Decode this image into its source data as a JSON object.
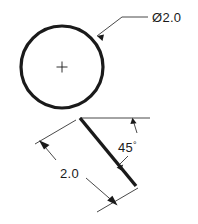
{
  "drawing": {
    "type": "engineering-dimension-sketch",
    "background_color": "#ffffff",
    "line_color": "#1a1a1a",
    "thick_stroke_width": 3.2,
    "thin_stroke_width": 0.8,
    "canvas": {
      "width": 198,
      "height": 224
    }
  },
  "annotations": {
    "diameter": {
      "label": "Ø2.0",
      "value": "2.0",
      "symbol": "Ø",
      "meaning": "diameter-of-circle",
      "text_x": 152,
      "text_y": 22
    },
    "angle": {
      "label": "45",
      "degree_symbol": "°",
      "value": "45",
      "meaning": "angle-between-horizontal-and-inclined-line",
      "text_x": 118,
      "text_y": 152
    },
    "length": {
      "label": "2.0",
      "value": "2.0",
      "meaning": "length-of-inclined-line",
      "text_x": 60,
      "text_y": 178
    }
  },
  "geometry": {
    "circle": {
      "name": "main-circle",
      "center_x": 62,
      "center_y": 67,
      "radius": 41
    },
    "center_mark": {
      "name": "center-cross",
      "x": 62,
      "y": 67,
      "arm": 5
    },
    "inclined_line": {
      "name": "inclined-tangent-line",
      "x1": 80,
      "y1": 118,
      "x2": 136,
      "y2": 186
    },
    "horizontal_reference": {
      "name": "horizontal-reference-line",
      "x1": 80,
      "y1": 118,
      "x2": 150,
      "y2": 118
    }
  }
}
